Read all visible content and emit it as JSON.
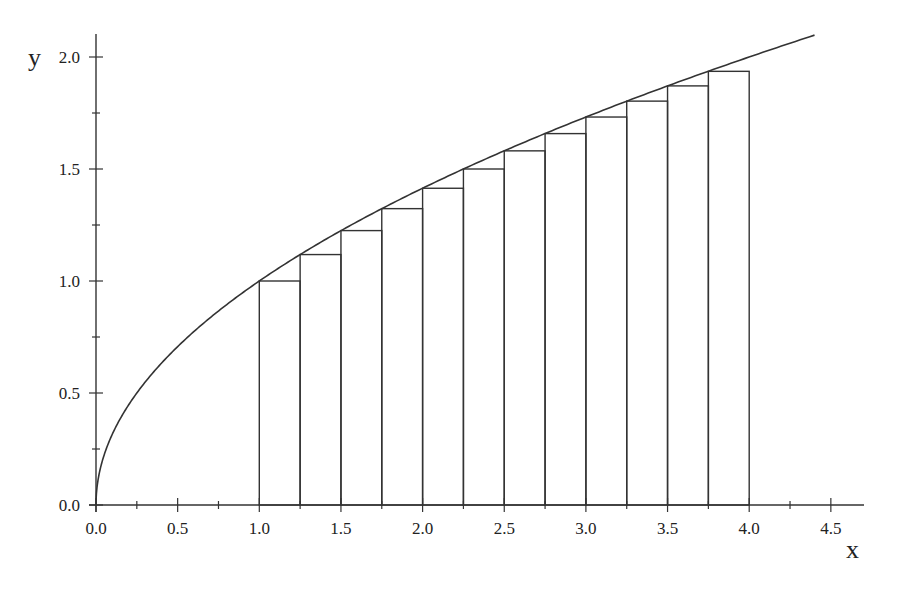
{
  "chart_data": {
    "type": "line",
    "title": "",
    "xlabel": "x",
    "ylabel": "y",
    "xlim": [
      0,
      4.7
    ],
    "ylim": [
      0,
      2.1
    ],
    "grid": false,
    "x_ticks": [
      "0.0",
      "0.5",
      "1.0",
      "1.5",
      "2.0",
      "2.5",
      "3.0",
      "3.5",
      "4.0",
      "4.5"
    ],
    "y_ticks": [
      "0.0",
      "0.5",
      "1.0",
      "1.5",
      "2.0"
    ],
    "series": [
      {
        "name": "y = sqrt(x)",
        "type": "line",
        "x_range": [
          0,
          4.4
        ],
        "function": "sqrt"
      }
    ],
    "rectangles": {
      "description": "Left-endpoint Riemann sum rectangles under y = sqrt(x)",
      "x_start": 1.0,
      "x_end": 4.0,
      "width": 0.25,
      "lefts": [
        1.0,
        1.25,
        1.5,
        1.75,
        2.0,
        2.25,
        2.5,
        2.75,
        3.0,
        3.25,
        3.5,
        3.75
      ],
      "heights": [
        1.0,
        1.118,
        1.225,
        1.323,
        1.414,
        1.5,
        1.581,
        1.658,
        1.732,
        1.803,
        1.871,
        1.936
      ]
    }
  }
}
